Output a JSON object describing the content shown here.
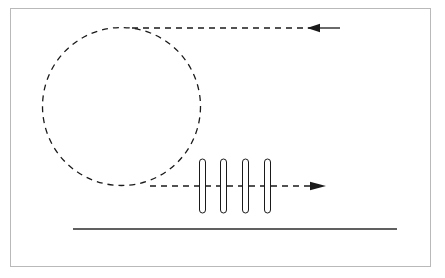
{
  "figure": {
    "title": "",
    "background_color": "#ffffff",
    "frame": {
      "name": "figure-border",
      "x": 10,
      "y": 8,
      "width": 421,
      "height": 259,
      "stroke_color": "#b9b9b9",
      "stroke_width": 1
    },
    "stroke_color": "#1a1a1a",
    "elements": {
      "loop": {
        "label": "dashed-circular-loop",
        "shape": "circle",
        "center_x": 121.5,
        "center_y": 106.5,
        "radius": 79,
        "stroke_width": 1.3,
        "dash_pattern": "6 5",
        "stroke_color": "#1a1a1a"
      },
      "upper_beam": {
        "label": "upper-dashed-beam-leftward",
        "shape": "dashed-line-with-arrowhead",
        "direction": "left",
        "x_start": 132,
        "x_end": 340,
        "y": 28,
        "arrow_tip_x": 307,
        "arrow_tail_x": 320,
        "solid_tail_from_x": 318,
        "stroke_width": 1.3,
        "dash_pattern": "6 5",
        "stroke_color": "#1a1a1a"
      },
      "lower_beam": {
        "label": "lower-dashed-beam-rightward",
        "shape": "dashed-line-with-arrowhead",
        "direction": "right",
        "x_start": 150,
        "x_end": 326,
        "y": 186,
        "arrow_tip_x": 326,
        "arrow_tail_x": 310,
        "stroke_width": 1.3,
        "dash_pattern": "6 5",
        "stroke_color": "#1a1a1a"
      },
      "plates": {
        "label": "vertical-capsule-plates",
        "shape": "rounded-capsule",
        "count": 4,
        "x_positions": [
          202.5,
          223.5,
          245.5,
          267.5
        ],
        "center_y": 186,
        "width": 6,
        "height": 54,
        "corner_radius": 3,
        "stroke_width": 1,
        "stroke_color": "#1a1a1a",
        "fill_color": "#ffffff"
      },
      "baseline": {
        "label": "bottom-solid-baseline",
        "shape": "solid-line",
        "x_start": 73,
        "x_end": 397,
        "y": 229,
        "stroke_width": 1.3,
        "stroke_color": "#2b2b2b"
      }
    }
  }
}
